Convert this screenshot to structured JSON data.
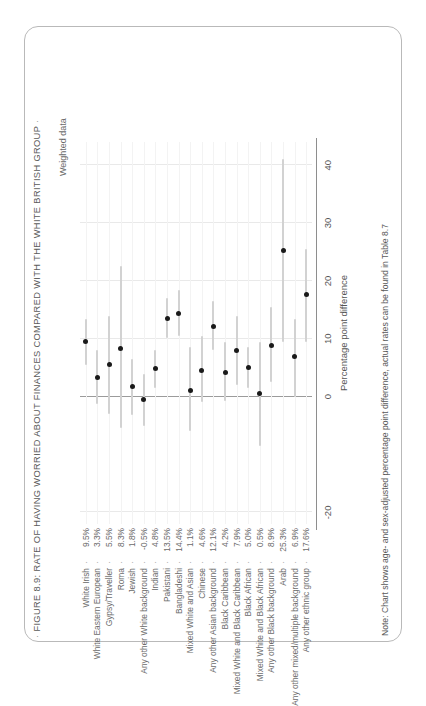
{
  "figure": {
    "title": "FIGURE 8.9: RATE OF HAVING WORRIED ABOUT FINANCES COMPARED WITH THE WHITE BRITISH GROUP",
    "lead_dash": "·",
    "trail_dash": "·",
    "weighted_caption": "Weighted data",
    "note": "Note: Chart shows age- and sex-adjusted percentage point difference, actual rates can be found in Table 8.7",
    "colors": {
      "marker": "#1a1a1a",
      "errorbar": "#d2d2d2",
      "gridline": "#e9e9e9",
      "zeroline": "#9b9b9b",
      "axis": "#8e8e8e",
      "text": "#5a5a5a",
      "card_border": "#b9b9b9",
      "background": "#ffffff"
    }
  },
  "chart_data": {
    "type": "scatter",
    "title": "FIGURE 8.9: RATE OF HAVING WORRIED ABOUT FINANCES COMPARED WITH THE WHITE BRITISH GROUP",
    "subtitle": "Weighted data",
    "xlabel": "Percentage point difference",
    "ylabel": "",
    "xlim": [
      -22,
      44
    ],
    "xticks": [
      -20,
      0,
      10,
      20,
      30,
      40
    ],
    "xticklabels": [
      "-20",
      "0",
      "10",
      "20",
      "30",
      "40"
    ],
    "grid": true,
    "legend": "none",
    "orientation": "horizontal-dotplot-with-error-bars",
    "value_dash": "·",
    "categories": [
      "White Irish",
      "White Eastern European",
      "Gypsy/Traveller",
      "Roma",
      "Jewish",
      "Any other White background",
      "Indian",
      "Pakistani",
      "Bangladeshi",
      "Mixed White and Asian",
      "Chinese",
      "Any other Asian background",
      "Black Caribbean",
      "Mixed White and Black Caribbean",
      "Black African",
      "Mixed White and Black African",
      "Any other Black background",
      "Arab",
      "Any other mixed/multiple background",
      "Any other ethnic group"
    ],
    "value_labels": [
      "9.5%",
      "3.3%",
      "5.5%",
      "8.3%",
      "1.8%",
      "-0.5%",
      "4.8%",
      "13.5%",
      "14.4%",
      "1.1%",
      "4.6%",
      "12.1%",
      "4.2%",
      "7.9%",
      "5.0%",
      "0.5%",
      "8.9%",
      "25.3%",
      "6.9%",
      "17.6%"
    ],
    "values": [
      9.5,
      3.3,
      5.5,
      8.3,
      1.8,
      -0.5,
      4.8,
      13.5,
      14.4,
      1.1,
      4.6,
      12.1,
      4.2,
      7.9,
      5.0,
      0.5,
      8.9,
      25.3,
      6.9,
      17.6
    ],
    "ci_low": [
      5.5,
      -1.2,
      -3.0,
      -5.5,
      -3.2,
      -5.0,
      1.5,
      10.2,
      10.5,
      -6.0,
      -1.0,
      8.0,
      -0.8,
      2.0,
      1.5,
      -8.5,
      2.5,
      9.5,
      0.0,
      9.5
    ],
    "ci_high": [
      13.5,
      8.0,
      14.0,
      22.5,
      6.5,
      4.0,
      8.0,
      17.0,
      18.5,
      8.5,
      10.5,
      16.5,
      9.5,
      14.0,
      8.5,
      9.5,
      15.5,
      41.0,
      13.5,
      25.5
    ]
  }
}
